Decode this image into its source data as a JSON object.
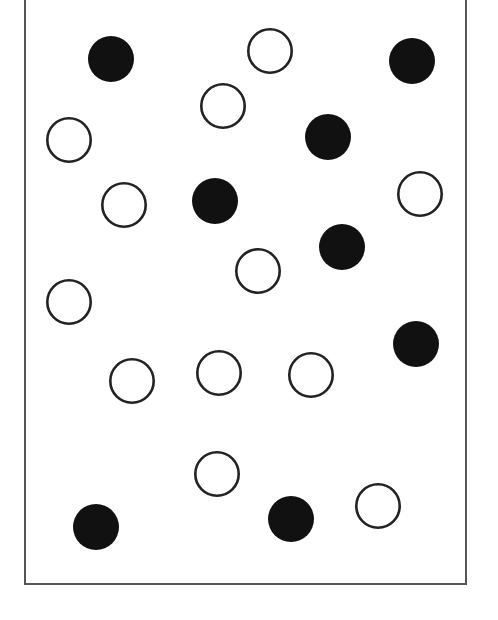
{
  "figure": {
    "width": 498,
    "height": 620,
    "background": "#ffffff",
    "frame": {
      "left": 25,
      "right": 466,
      "bottom": 584,
      "top_open": true,
      "stroke": "#555555",
      "stroke_width": 2
    },
    "circle_radius": 23,
    "filled_color": "#111111",
    "open_stroke": "#222222",
    "open_stroke_width": 2.6,
    "counts": {
      "filled": 8,
      "open": 12,
      "total": 20
    },
    "circles": [
      {
        "id": "filled-1",
        "type": "filled",
        "cx": 111,
        "cy": 59
      },
      {
        "id": "open-1",
        "type": "open",
        "cx": 270,
        "cy": 51
      },
      {
        "id": "filled-2",
        "type": "filled",
        "cx": 412,
        "cy": 61
      },
      {
        "id": "open-2",
        "type": "open",
        "cx": 223,
        "cy": 106
      },
      {
        "id": "open-3",
        "type": "open",
        "cx": 69,
        "cy": 140
      },
      {
        "id": "filled-3",
        "type": "filled",
        "cx": 328,
        "cy": 137
      },
      {
        "id": "open-4",
        "type": "open",
        "cx": 124,
        "cy": 205
      },
      {
        "id": "filled-4",
        "type": "filled",
        "cx": 215,
        "cy": 201
      },
      {
        "id": "open-5",
        "type": "open",
        "cx": 420,
        "cy": 194
      },
      {
        "id": "filled-5",
        "type": "filled",
        "cx": 342,
        "cy": 247
      },
      {
        "id": "open-6",
        "type": "open",
        "cx": 258,
        "cy": 271
      },
      {
        "id": "open-7",
        "type": "open",
        "cx": 69,
        "cy": 302
      },
      {
        "id": "filled-6",
        "type": "filled",
        "cx": 416,
        "cy": 344
      },
      {
        "id": "open-8",
        "type": "open",
        "cx": 132,
        "cy": 381
      },
      {
        "id": "open-9",
        "type": "open",
        "cx": 219,
        "cy": 373
      },
      {
        "id": "open-10",
        "type": "open",
        "cx": 311,
        "cy": 375
      },
      {
        "id": "open-11",
        "type": "open",
        "cx": 217,
        "cy": 474
      },
      {
        "id": "filled-7",
        "type": "filled",
        "cx": 96,
        "cy": 527
      },
      {
        "id": "filled-8",
        "type": "filled",
        "cx": 291,
        "cy": 519
      },
      {
        "id": "open-12",
        "type": "open",
        "cx": 378,
        "cy": 506
      }
    ]
  }
}
